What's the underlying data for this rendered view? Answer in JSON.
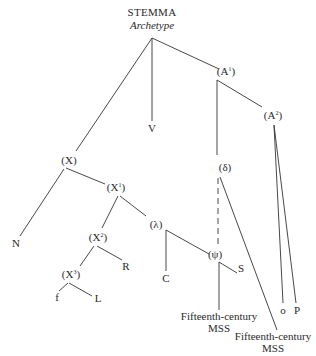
{
  "diagram": {
    "title": "STEMMA",
    "subtitle": "Archetype",
    "line_color": "#333333",
    "nodes": {
      "archetype_apex": {
        "x": 152,
        "y": 38
      },
      "A1": {
        "base": "(A",
        "sup": "1",
        "close": ")",
        "x": 226,
        "y": 71
      },
      "A2": {
        "base": "(A",
        "sup": "2",
        "close": ")",
        "x": 273,
        "y": 115
      },
      "V": {
        "label": "V",
        "x": 152,
        "y": 128
      },
      "X": {
        "base": "(X",
        "sup": "",
        "close": ")",
        "x": 69,
        "y": 160
      },
      "delta": {
        "label": "(δ)",
        "x": 225,
        "y": 167
      },
      "X1": {
        "base": "(X",
        "sup": "1",
        "close": ")",
        "x": 116,
        "y": 186
      },
      "X2": {
        "base": "(X",
        "sup": "2",
        "close": ")",
        "x": 98,
        "y": 237
      },
      "lambda": {
        "label": "(λ)",
        "x": 156,
        "y": 224
      },
      "psi": {
        "label": "(ψ)",
        "x": 216,
        "y": 253
      },
      "N": {
        "label": "N",
        "x": 16,
        "y": 243
      },
      "R": {
        "label": "R",
        "x": 126,
        "y": 266
      },
      "S": {
        "label": "S",
        "x": 240,
        "y": 267
      },
      "C": {
        "label": "C",
        "x": 166,
        "y": 277
      },
      "X3": {
        "base": "(X",
        "sup": "3",
        "close": ")",
        "x": 71,
        "y": 274
      },
      "f": {
        "label": "f",
        "x": 57,
        "y": 296
      },
      "L": {
        "label": "L",
        "x": 98,
        "y": 298
      },
      "o": {
        "label": "o",
        "x": 283,
        "y": 310
      },
      "P": {
        "label": "P",
        "x": 297,
        "y": 310
      }
    },
    "ms_groups": [
      {
        "line1": "Fifteenth-century",
        "line2": "MSS",
        "x": 219,
        "y": 322
      },
      {
        "line1": "Fifteenth-century",
        "line2": "MSS",
        "x": 273,
        "y": 342
      }
    ],
    "edges": [
      {
        "from": "Archetype",
        "to": "(A1)",
        "style": "solid"
      },
      {
        "from": "Archetype",
        "to": "V",
        "style": "solid"
      },
      {
        "from": "Archetype",
        "to": "(X)",
        "style": "solid"
      },
      {
        "from": "(A1)",
        "to": "(A2)",
        "style": "solid"
      },
      {
        "from": "(A1)",
        "to": "(δ)",
        "style": "solid"
      },
      {
        "from": "(A2)",
        "to": "o",
        "style": "solid"
      },
      {
        "from": "(A2)",
        "to": "P",
        "style": "solid"
      },
      {
        "from": "(X)",
        "to": "N",
        "style": "solid"
      },
      {
        "from": "(X)",
        "to": "(X1)",
        "style": "solid"
      },
      {
        "from": "(X1)",
        "to": "(X2)",
        "style": "solid"
      },
      {
        "from": "(X1)",
        "to": "(λ)",
        "style": "solid"
      },
      {
        "from": "(X2)",
        "to": "(X3)",
        "style": "solid"
      },
      {
        "from": "(X2)",
        "to": "R",
        "style": "solid"
      },
      {
        "from": "(X3)",
        "to": "f",
        "style": "solid"
      },
      {
        "from": "(X3)",
        "to": "L",
        "style": "solid"
      },
      {
        "from": "(λ)",
        "to": "C",
        "style": "solid"
      },
      {
        "from": "(λ)",
        "to": "(ψ)",
        "style": "solid"
      },
      {
        "from": "(ψ)",
        "to": "S",
        "style": "solid"
      },
      {
        "from": "(ψ)",
        "to": "Fifteenth-century MSS (1)",
        "style": "solid"
      },
      {
        "from": "(δ)",
        "to": "(ψ)",
        "style": "dashed"
      },
      {
        "from": "(δ)",
        "to": "Fifteenth-century MSS (2)",
        "style": "solid"
      }
    ]
  }
}
